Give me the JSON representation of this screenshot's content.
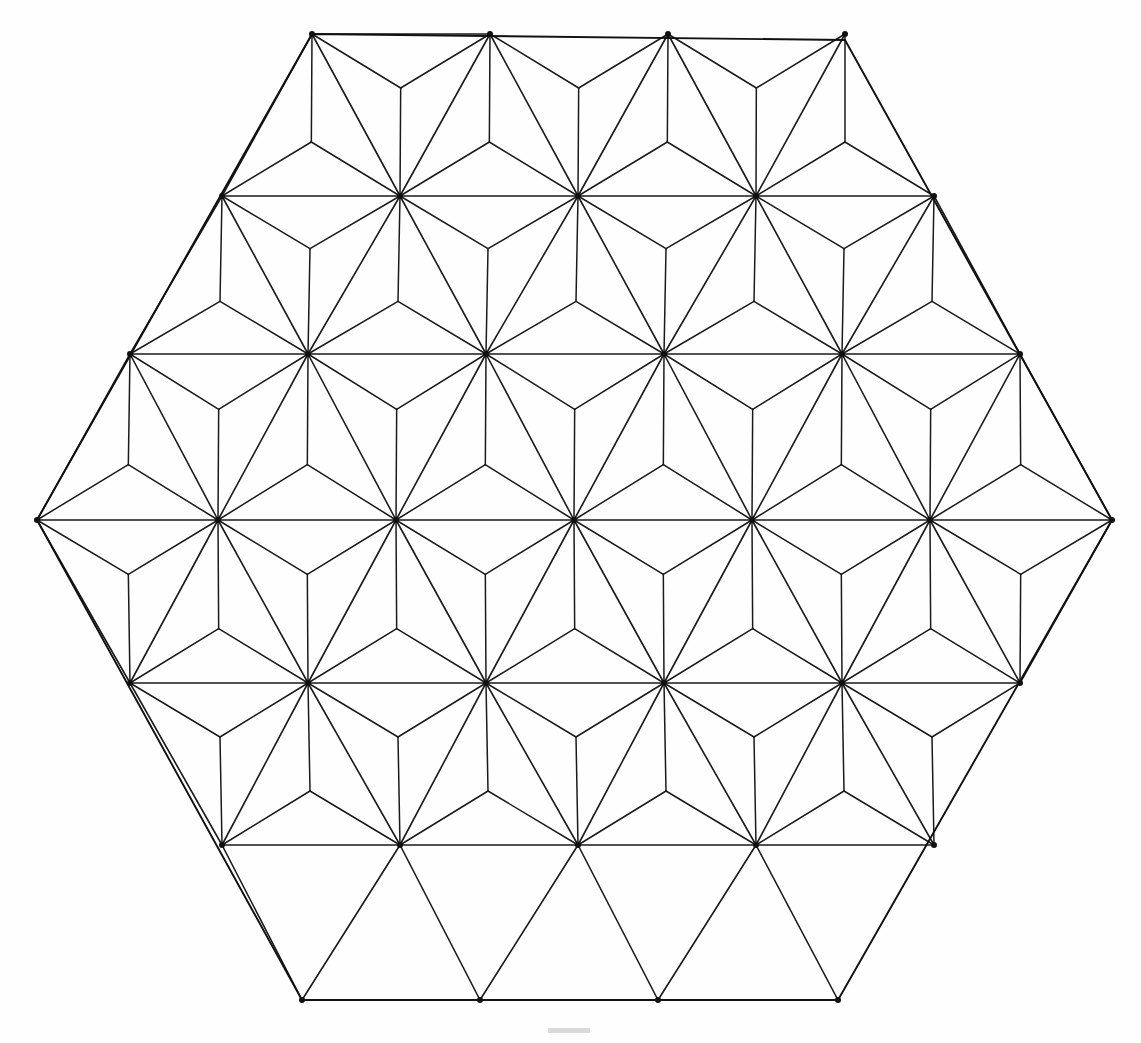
{
  "figure": {
    "title": "Asanoha hexagonal tessellation",
    "background_color": "#fefefe",
    "line_color": "#1a1a1a",
    "boundary_color": "#111111",
    "node_color": "#111111",
    "canvas": {
      "width": 1141,
      "height": 1043
    }
  },
  "geometry": {
    "lattice_type": "triangular",
    "pattern_name": "asanoha",
    "column_spacing": 178.0,
    "row_spacing": 162.3,
    "row_offset": 89.0,
    "origin_x": 37,
    "origin_y": 34,
    "rows": 7,
    "hexagon_vertices": [
      {
        "label": "top-left",
        "x": 312,
        "y": 34
      },
      {
        "label": "top-right",
        "x": 845,
        "y": 40
      },
      {
        "label": "right",
        "x": 1112,
        "y": 520
      },
      {
        "label": "bottom-right",
        "x": 838,
        "y": 1000
      },
      {
        "label": "bottom-left",
        "x": 302,
        "y": 1000
      },
      {
        "label": "left",
        "x": 37,
        "y": 520
      }
    ],
    "lattice_rows": [
      {
        "y": 34,
        "xs": [
          312,
          490,
          668,
          845
        ]
      },
      {
        "y": 196,
        "xs": [
          222,
          400,
          578,
          756,
          934
        ]
      },
      {
        "y": 354,
        "xs": [
          130,
          308,
          486,
          664,
          842,
          1020
        ]
      },
      {
        "y": 520,
        "xs": [
          37,
          218,
          396,
          574,
          752,
          930,
          1112
        ]
      },
      {
        "y": 683,
        "xs": [
          130,
          308,
          486,
          664,
          842,
          1020
        ]
      },
      {
        "y": 845,
        "xs": [
          222,
          400,
          578,
          756,
          934
        ]
      },
      {
        "y": 1000,
        "xs": [
          302,
          480,
          658,
          838
        ]
      }
    ],
    "star_spoke_count": 12
  },
  "stroke": {
    "lattice_width": 1.6,
    "spoke_width": 1.5,
    "boundary_width": 1.9,
    "node_radius": 3.0
  },
  "artifact": {
    "name": "faint-scan-mark",
    "x": 548,
    "y": 1028,
    "width": 42,
    "height": 5,
    "color": "#d9d9d9"
  }
}
